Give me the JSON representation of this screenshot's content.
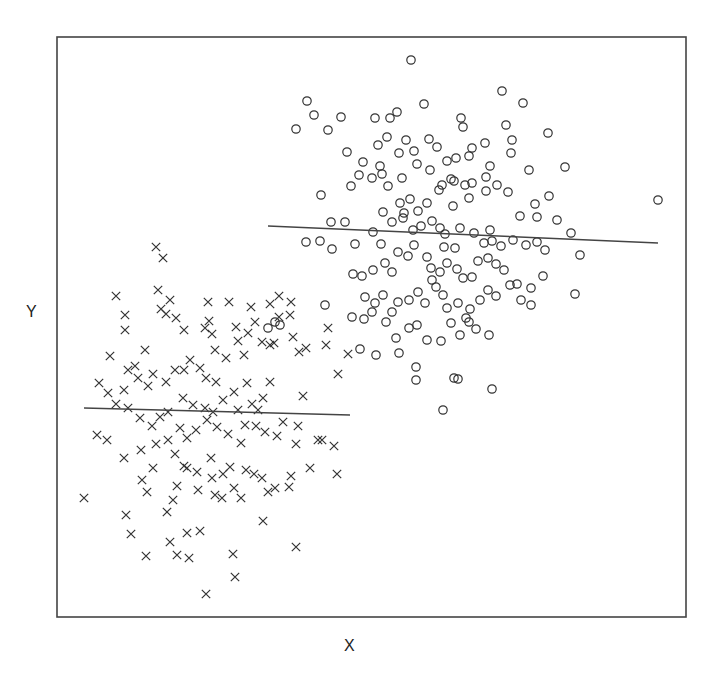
{
  "chart_data": {
    "type": "scatter",
    "title": "",
    "xlabel": "X",
    "ylabel": "Y",
    "grid": false,
    "legend": null,
    "coordinate_system": "pixel (screen coordinates of plot area; y increases downward)",
    "plot_area": {
      "left": 57,
      "top": 37,
      "right": 686,
      "bottom": 617
    },
    "colors": {
      "frame": "#444444",
      "marker": "#333333",
      "line": "#444444",
      "background": "#ffffff"
    },
    "series": [
      {
        "name": "group-circles",
        "marker": "circle",
        "regression_line": {
          "x1": 268,
          "y1": 226,
          "x2": 658,
          "y2": 243
        },
        "points": [
          [
            411,
            60
          ],
          [
            307,
            101
          ],
          [
            296,
            129
          ],
          [
            314,
            115
          ],
          [
            328,
            130
          ],
          [
            341,
            117
          ],
          [
            375,
            118
          ],
          [
            390,
            118
          ],
          [
            397,
            112
          ],
          [
            424,
            104
          ],
          [
            461,
            118
          ],
          [
            463,
            127
          ],
          [
            502,
            91
          ],
          [
            523,
            103
          ],
          [
            548,
            133
          ],
          [
            506,
            125
          ],
          [
            485,
            143
          ],
          [
            437,
            147
          ],
          [
            456,
            158
          ],
          [
            378,
            145
          ],
          [
            406,
            140
          ],
          [
            387,
            137
          ],
          [
            347,
            152
          ],
          [
            363,
            162
          ],
          [
            399,
            153
          ],
          [
            414,
            151
          ],
          [
            429,
            139
          ],
          [
            447,
            161
          ],
          [
            469,
            156
          ],
          [
            472,
            148
          ],
          [
            490,
            166
          ],
          [
            511,
            153
          ],
          [
            512,
            140
          ],
          [
            529,
            170
          ],
          [
            565,
            167
          ],
          [
            380,
            166
          ],
          [
            382,
            174
          ],
          [
            359,
            175
          ],
          [
            402,
            178
          ],
          [
            417,
            164
          ],
          [
            430,
            170
          ],
          [
            442,
            185
          ],
          [
            454,
            181
          ],
          [
            465,
            185
          ],
          [
            469,
            198
          ],
          [
            486,
            191
          ],
          [
            497,
            185
          ],
          [
            508,
            192
          ],
          [
            535,
            204
          ],
          [
            549,
            196
          ],
          [
            321,
            195
          ],
          [
            351,
            186
          ],
          [
            372,
            178
          ],
          [
            388,
            186
          ],
          [
            400,
            203
          ],
          [
            404,
            213
          ],
          [
            410,
            199
          ],
          [
            418,
            211
          ],
          [
            427,
            203
          ],
          [
            439,
            190
          ],
          [
            451,
            179
          ],
          [
            472,
            183
          ],
          [
            486,
            177
          ],
          [
            520,
            216
          ],
          [
            537,
            217
          ],
          [
            557,
            220
          ],
          [
            571,
            233
          ],
          [
            580,
            255
          ],
          [
            575,
            294
          ],
          [
            658,
            200
          ],
          [
            345,
            222
          ],
          [
            331,
            222
          ],
          [
            320,
            241
          ],
          [
            306,
            242
          ],
          [
            332,
            249
          ],
          [
            355,
            244
          ],
          [
            373,
            232
          ],
          [
            381,
            244
          ],
          [
            383,
            212
          ],
          [
            392,
            222
          ],
          [
            403,
            218
          ],
          [
            413,
            230
          ],
          [
            421,
            226
          ],
          [
            432,
            221
          ],
          [
            440,
            228
          ],
          [
            445,
            234
          ],
          [
            455,
            248
          ],
          [
            460,
            228
          ],
          [
            474,
            233
          ],
          [
            484,
            243
          ],
          [
            492,
            241
          ],
          [
            501,
            246
          ],
          [
            513,
            240
          ],
          [
            526,
            245
          ],
          [
            537,
            242
          ],
          [
            545,
            250
          ],
          [
            373,
            270
          ],
          [
            385,
            263
          ],
          [
            392,
            272
          ],
          [
            398,
            252
          ],
          [
            408,
            256
          ],
          [
            414,
            245
          ],
          [
            427,
            257
          ],
          [
            431,
            268
          ],
          [
            440,
            272
          ],
          [
            447,
            263
          ],
          [
            457,
            269
          ],
          [
            463,
            278
          ],
          [
            472,
            277
          ],
          [
            478,
            261
          ],
          [
            488,
            258
          ],
          [
            496,
            264
          ],
          [
            504,
            270
          ],
          [
            517,
            284
          ],
          [
            531,
            288
          ],
          [
            543,
            276
          ],
          [
            353,
            274
          ],
          [
            362,
            276
          ],
          [
            325,
            305
          ],
          [
            352,
            317
          ],
          [
            364,
            319
          ],
          [
            375,
            303
          ],
          [
            383,
            295
          ],
          [
            392,
            312
          ],
          [
            398,
            302
          ],
          [
            409,
            300
          ],
          [
            418,
            292
          ],
          [
            425,
            303
          ],
          [
            436,
            287
          ],
          [
            443,
            295
          ],
          [
            447,
            308
          ],
          [
            458,
            303
          ],
          [
            466,
            318
          ],
          [
            470,
            309
          ],
          [
            480,
            300
          ],
          [
            488,
            290
          ],
          [
            496,
            296
          ],
          [
            510,
            285
          ],
          [
            521,
            300
          ],
          [
            531,
            305
          ],
          [
            365,
            297
          ],
          [
            372,
            312
          ],
          [
            386,
            322
          ],
          [
            396,
            338
          ],
          [
            409,
            328
          ],
          [
            417,
            325
          ],
          [
            427,
            340
          ],
          [
            441,
            341
          ],
          [
            451,
            323
          ],
          [
            460,
            335
          ],
          [
            469,
            322
          ],
          [
            476,
            329
          ],
          [
            489,
            335
          ],
          [
            360,
            349
          ],
          [
            376,
            355
          ],
          [
            399,
            353
          ],
          [
            416,
            367
          ],
          [
            454,
            378
          ],
          [
            458,
            379
          ],
          [
            492,
            389
          ],
          [
            443,
            410
          ],
          [
            416,
            380
          ],
          [
            275,
            322
          ],
          [
            280,
            325
          ],
          [
            268,
            328
          ],
          [
            432,
            280
          ],
          [
            444,
            247
          ],
          [
            490,
            230
          ],
          [
            453,
            206
          ]
        ]
      },
      {
        "name": "group-crosses",
        "marker": "cross",
        "regression_line": {
          "x1": 84,
          "y1": 408,
          "x2": 350,
          "y2": 415
        },
        "points": [
          [
            156,
            247
          ],
          [
            163,
            258
          ],
          [
            116,
            296
          ],
          [
            158,
            290
          ],
          [
            125,
            315
          ],
          [
            125,
            330
          ],
          [
            161,
            309
          ],
          [
            166,
            314
          ],
          [
            170,
            300
          ],
          [
            176,
            318
          ],
          [
            184,
            330
          ],
          [
            208,
            302
          ],
          [
            209,
            321
          ],
          [
            229,
            302
          ],
          [
            251,
            307
          ],
          [
            270,
            304
          ],
          [
            279,
            317
          ],
          [
            291,
            302
          ],
          [
            279,
            296
          ],
          [
            290,
            315
          ],
          [
            293,
            337
          ],
          [
            274,
            343
          ],
          [
            212,
            334
          ],
          [
            205,
            328
          ],
          [
            236,
            327
          ],
          [
            238,
            341
          ],
          [
            248,
            333
          ],
          [
            255,
            322
          ],
          [
            215,
            350
          ],
          [
            226,
            358
          ],
          [
            244,
            355
          ],
          [
            262,
            342
          ],
          [
            270,
            345
          ],
          [
            299,
            352
          ],
          [
            306,
            348
          ],
          [
            328,
            328
          ],
          [
            326,
            345
          ],
          [
            348,
            354
          ],
          [
            338,
            374
          ],
          [
            303,
            396
          ],
          [
            318,
            440
          ],
          [
            334,
            446
          ],
          [
            283,
            422
          ],
          [
            296,
            444
          ],
          [
            322,
            440
          ],
          [
            298,
            426
          ],
          [
            110,
            356
          ],
          [
            135,
            366
          ],
          [
            145,
            350
          ],
          [
            124,
            390
          ],
          [
            128,
            370
          ],
          [
            138,
            378
          ],
          [
            148,
            386
          ],
          [
            153,
            374
          ],
          [
            166,
            382
          ],
          [
            175,
            370
          ],
          [
            184,
            370
          ],
          [
            190,
            360
          ],
          [
            200,
            368
          ],
          [
            206,
            378
          ],
          [
            216,
            382
          ],
          [
            183,
            398
          ],
          [
            193,
            405
          ],
          [
            205,
            408
          ],
          [
            213,
            412
          ],
          [
            223,
            400
          ],
          [
            238,
            410
          ],
          [
            252,
            404
          ],
          [
            258,
            410
          ],
          [
            263,
            398
          ],
          [
            270,
            382
          ],
          [
            247,
            383
          ],
          [
            234,
            392
          ],
          [
            99,
            383
          ],
          [
            108,
            393
          ],
          [
            116,
            404
          ],
          [
            128,
            408
          ],
          [
            140,
            418
          ],
          [
            152,
            426
          ],
          [
            160,
            417
          ],
          [
            168,
            412
          ],
          [
            180,
            428
          ],
          [
            187,
            438
          ],
          [
            196,
            430
          ],
          [
            207,
            420
          ],
          [
            217,
            427
          ],
          [
            228,
            434
          ],
          [
            241,
            443
          ],
          [
            245,
            425
          ],
          [
            256,
            426
          ],
          [
            265,
            432
          ],
          [
            277,
            436
          ],
          [
            97,
            435
          ],
          [
            107,
            440
          ],
          [
            124,
            458
          ],
          [
            141,
            450
          ],
          [
            156,
            444
          ],
          [
            168,
            440
          ],
          [
            175,
            454
          ],
          [
            187,
            468
          ],
          [
            197,
            472
          ],
          [
            211,
            458
          ],
          [
            223,
            474
          ],
          [
            234,
            488
          ],
          [
            246,
            470
          ],
          [
            268,
            492
          ],
          [
            291,
            476
          ],
          [
            310,
            468
          ],
          [
            337,
            474
          ],
          [
            153,
            468
          ],
          [
            142,
            480
          ],
          [
            147,
            492
          ],
          [
            173,
            500
          ],
          [
            177,
            486
          ],
          [
            184,
            466
          ],
          [
            212,
            478
          ],
          [
            215,
            495
          ],
          [
            222,
            498
          ],
          [
            241,
            498
          ],
          [
            262,
            478
          ],
          [
            275,
            488
          ],
          [
            289,
            487
          ],
          [
            84,
            498
          ],
          [
            126,
            515
          ],
          [
            131,
            534
          ],
          [
            146,
            556
          ],
          [
            167,
            512
          ],
          [
            170,
            542
          ],
          [
            187,
            533
          ],
          [
            177,
            555
          ],
          [
            189,
            558
          ],
          [
            200,
            531
          ],
          [
            233,
            554
          ],
          [
            235,
            577
          ],
          [
            263,
            521
          ],
          [
            296,
            547
          ],
          [
            206,
            594
          ],
          [
            198,
            490
          ],
          [
            230,
            467
          ],
          [
            254,
            474
          ]
        ]
      }
    ]
  },
  "axes": {
    "x_label": "X",
    "y_label": "Y"
  }
}
